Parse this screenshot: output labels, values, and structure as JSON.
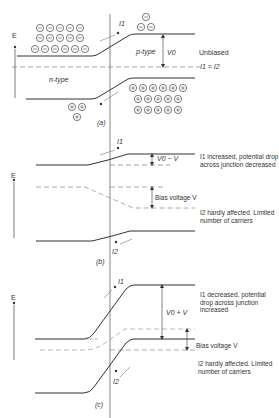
{
  "figure": {
    "axis_label": "E",
    "panels": [
      {
        "id": "a",
        "caption": "(a)",
        "state": "Unbiased",
        "labels": {
          "p_region": "p-type",
          "n_region": "n-type",
          "barrier": "V0",
          "current_top": "I1",
          "current_relation": "I1 = I2"
        },
        "carriers": {
          "electrons_left": 17,
          "electrons_right": 3,
          "holes_right": 17,
          "holes_left": 3
        }
      },
      {
        "id": "b",
        "caption": "(b)",
        "labels": {
          "barrier": "V0 − V",
          "bias": "Bias voltage V",
          "current_top": "I1",
          "current_bottom": "I2",
          "note_top": "I1 increased, potential drop across junction decreased",
          "note_bottom": "I2 hardly affected. Limited number of carriers"
        }
      },
      {
        "id": "c",
        "caption": "(c)",
        "labels": {
          "barrier": "V0 + V",
          "bias": "Bias voltage V",
          "current_top": "I1",
          "current_bottom": "I2",
          "note_top": "I1 decreased, potential drop across junction increased",
          "note_bottom": "I2 hardly affected. Limited number of carriers"
        }
      }
    ]
  }
}
